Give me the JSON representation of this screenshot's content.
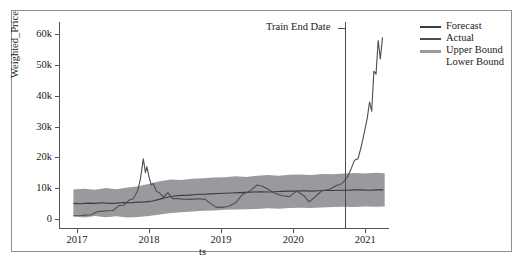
{
  "chart_data": {
    "type": "line",
    "title": "",
    "xlabel": "ts",
    "ylabel": "Weighted_Price",
    "xlim": [
      2016.75,
      2021.33
    ],
    "ylim": [
      -3000,
      64000
    ],
    "grid": false,
    "legend_position": "upper right",
    "xticks": [
      {
        "label": "2017",
        "value": 2017
      },
      {
        "label": "2018",
        "value": 2018
      },
      {
        "label": "2019",
        "value": 2019
      },
      {
        "label": "2020",
        "value": 2020
      },
      {
        "label": "2021",
        "value": 2021
      }
    ],
    "yticks": [
      {
        "label": "0",
        "value": 0
      },
      {
        "label": "10k",
        "value": 10000
      },
      {
        "label": "20k",
        "value": 20000
      },
      {
        "label": "30k",
        "value": 30000
      },
      {
        "label": "40k",
        "value": 40000
      },
      {
        "label": "50k",
        "value": 50000
      },
      {
        "label": "60k",
        "value": 60000
      }
    ],
    "annotations": [
      {
        "text": "Train End Date",
        "x": 2020.72,
        "type": "vline-label"
      }
    ],
    "vline": {
      "x": 2020.72,
      "color": "#4a4a4f"
    },
    "legend": [
      {
        "name": "Forecast",
        "color": "#3a3a3f",
        "has_swatch": true
      },
      {
        "name": "Actual",
        "color": "#4d4d52",
        "has_swatch": true
      },
      {
        "name": "Upper Bound",
        "color": "#9a9a9e",
        "has_swatch": true
      },
      {
        "name": "Lower Bound",
        "color": "#9a9a9e",
        "has_swatch": false
      }
    ],
    "series": [
      {
        "name": "Forecast",
        "color": "#3a3a3f",
        "x": [
          2016.95,
          2017.05,
          2017.15,
          2017.25,
          2017.35,
          2017.45,
          2017.55,
          2017.65,
          2017.75,
          2017.85,
          2017.95,
          2018.05,
          2018.15,
          2018.25,
          2018.35,
          2018.45,
          2018.55,
          2018.65,
          2018.75,
          2018.85,
          2018.95,
          2019.05,
          2019.15,
          2019.25,
          2019.35,
          2019.45,
          2019.55,
          2019.65,
          2019.75,
          2019.85,
          2019.95,
          2020.05,
          2020.15,
          2020.25,
          2020.35,
          2020.45,
          2020.55,
          2020.65,
          2020.75,
          2020.85,
          2020.95,
          2021.05,
          2021.15,
          2021.25
        ],
        "y": [
          5000,
          4900,
          5100,
          5000,
          5200,
          5000,
          5100,
          5300,
          5200,
          5400,
          5500,
          5800,
          6400,
          7000,
          7400,
          7600,
          7700,
          7900,
          8000,
          8100,
          8200,
          8300,
          8400,
          8500,
          8600,
          8700,
          8800,
          8700,
          8800,
          8900,
          9000,
          9000,
          9100,
          9000,
          9100,
          9200,
          9200,
          9300,
          9300,
          9400,
          9400,
          9300,
          9400,
          9400
        ]
      },
      {
        "name": "Actual",
        "color": "#4d4d52",
        "x": [
          2016.95,
          2017.05,
          2017.12,
          2017.2,
          2017.28,
          2017.35,
          2017.42,
          2017.5,
          2017.58,
          2017.65,
          2017.72,
          2017.78,
          2017.84,
          2017.88,
          2017.92,
          2017.95,
          2017.97,
          2018.0,
          2018.03,
          2018.06,
          2018.1,
          2018.14,
          2018.2,
          2018.26,
          2018.33,
          2018.4,
          2018.47,
          2018.55,
          2018.62,
          2018.7,
          2018.78,
          2018.85,
          2018.93,
          2019.0,
          2019.1,
          2019.2,
          2019.3,
          2019.4,
          2019.5,
          2019.58,
          2019.66,
          2019.75,
          2019.85,
          2019.95,
          2020.05,
          2020.15,
          2020.22,
          2020.3,
          2020.4,
          2020.5,
          2020.6,
          2020.68,
          2020.75,
          2020.8,
          2020.85,
          2020.9,
          2020.95,
          2021.0,
          2021.03,
          2021.06,
          2021.09,
          2021.12,
          2021.15,
          2021.18,
          2021.21,
          2021.24
        ],
        "y": [
          1000,
          1050,
          1200,
          1300,
          2300,
          2500,
          2600,
          2700,
          4300,
          4400,
          6000,
          6500,
          9000,
          13000,
          19500,
          15000,
          17000,
          13500,
          11000,
          11500,
          9000,
          8500,
          7000,
          8500,
          6500,
          6600,
          6400,
          6300,
          6400,
          6500,
          6300,
          5000,
          3800,
          3700,
          4000,
          5200,
          8000,
          9000,
          11000,
          10500,
          9500,
          8200,
          7500,
          7200,
          9000,
          7500,
          5500,
          7000,
          9200,
          9500,
          10800,
          11500,
          13500,
          16000,
          19000,
          19500,
          24000,
          29500,
          33000,
          38000,
          35000,
          48000,
          47000,
          58000,
          52000,
          59000
        ]
      }
    ],
    "confidence_band": {
      "name": "Bounds",
      "color": "#9a9a9e",
      "x": [
        2016.95,
        2017.1,
        2017.25,
        2017.4,
        2017.55,
        2017.7,
        2017.85,
        2018.0,
        2018.15,
        2018.3,
        2018.45,
        2018.6,
        2018.75,
        2018.9,
        2019.05,
        2019.2,
        2019.35,
        2019.5,
        2019.65,
        2019.8,
        2019.95,
        2020.1,
        2020.25,
        2020.4,
        2020.55,
        2020.7,
        2020.85,
        2021.0,
        2021.15,
        2021.27
      ],
      "upper": [
        9500,
        9800,
        9400,
        10000,
        9600,
        10200,
        10600,
        11400,
        12200,
        12800,
        12600,
        13000,
        13200,
        13400,
        13500,
        13800,
        13600,
        14000,
        14200,
        14000,
        14300,
        14400,
        14200,
        14600,
        14500,
        14700,
        14900,
        14700,
        15000,
        14800
      ],
      "lower": [
        700,
        400,
        900,
        500,
        800,
        400,
        600,
        900,
        1400,
        1900,
        2100,
        2400,
        2600,
        2700,
        2900,
        3000,
        3100,
        3200,
        3400,
        3300,
        3500,
        3600,
        3500,
        3700,
        3800,
        3900,
        3800,
        4000,
        3900,
        4000
      ]
    }
  },
  "axis": {
    "ylabel": "Weighted_Price",
    "xlabel": "ts"
  },
  "annotation": {
    "train_end_date": "Train End Date"
  }
}
